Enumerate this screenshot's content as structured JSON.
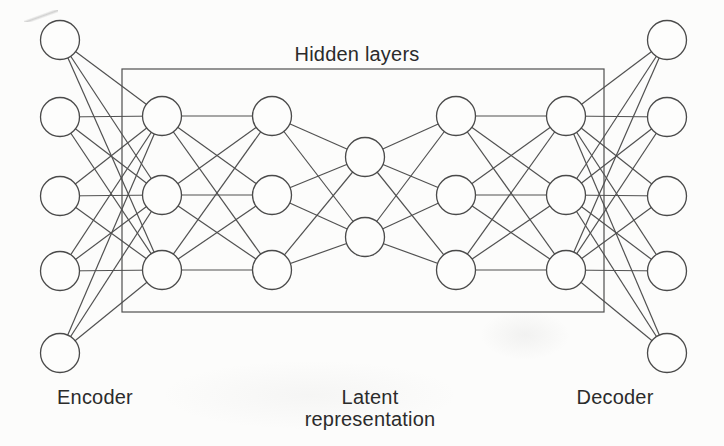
{
  "figure": {
    "background": "#fcfcfb",
    "edge_color": "#515151",
    "node_stroke_color": "#4a4a4a",
    "node_fill": "#fdfdfc",
    "box_stroke_color": "#4f4f4f",
    "text_color": "#2b2b2b",
    "node_radius": 19.5,
    "edge_stroke_width": 1.2,
    "node_stroke_width": 1.3,
    "box_stroke_width": 1.2
  },
  "labels": {
    "hidden_layers": "Hidden layers",
    "encoder": "Encoder",
    "latent_line1": "Latent",
    "latent_line2": "representation",
    "decoder": "Decoder"
  },
  "network": {
    "type": "autoencoder",
    "fully_connected_between_adjacent_layers": true,
    "layers": [
      {
        "name": "encoder-input",
        "x": 60,
        "node_ys": [
          40,
          117,
          196,
          271,
          353
        ]
      },
      {
        "name": "hidden-1",
        "x": 162,
        "node_ys": [
          116,
          195,
          270
        ]
      },
      {
        "name": "hidden-2",
        "x": 272,
        "node_ys": [
          116,
          195,
          270
        ]
      },
      {
        "name": "latent",
        "x": 365,
        "node_ys": [
          157,
          237
        ]
      },
      {
        "name": "hidden-3",
        "x": 456,
        "node_ys": [
          116,
          195,
          270
        ]
      },
      {
        "name": "hidden-4",
        "x": 566,
        "node_ys": [
          116,
          195,
          270
        ]
      },
      {
        "name": "decoder-output",
        "x": 667,
        "node_ys": [
          40,
          117,
          196,
          271,
          353
        ]
      }
    ],
    "hidden_box": {
      "x": 122,
      "y": 69,
      "width": 482,
      "height": 243
    }
  }
}
